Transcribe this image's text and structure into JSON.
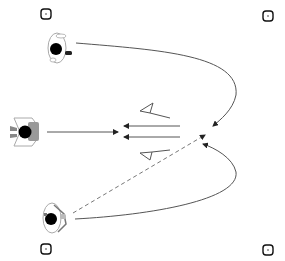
{
  "diagram": {
    "type": "training-drill-top-view",
    "background": "#ffffff",
    "colors": {
      "line": "#555555",
      "marker": "#111111",
      "head": "#000000",
      "body_outline": "#999999",
      "shoulder": "#888888"
    },
    "corner_markers": [
      {
        "id": "tl",
        "x": 46,
        "y": 14
      },
      {
        "id": "tr",
        "x": 268,
        "y": 16
      },
      {
        "id": "bl",
        "x": 46,
        "y": 249
      },
      {
        "id": "br",
        "x": 268,
        "y": 250
      }
    ],
    "players": [
      {
        "id": "top-player",
        "x": 56,
        "y": 48,
        "facing": "right"
      },
      {
        "id": "middle-player",
        "x": 25,
        "y": 131,
        "facing": "right",
        "shaded": true
      },
      {
        "id": "bottom-player",
        "x": 51,
        "y": 218,
        "facing": "right"
      }
    ],
    "arrows": [
      {
        "id": "top-curve",
        "style": "solid",
        "from": [
          76,
          43
        ],
        "to": [
          213,
          126
        ]
      },
      {
        "id": "bottom-curve",
        "style": "solid",
        "from": [
          75,
          219
        ],
        "to": [
          203,
          144
        ]
      },
      {
        "id": "dashed-diagonal",
        "style": "dashed",
        "from": [
          73,
          213
        ],
        "to": [
          205,
          135
        ]
      },
      {
        "id": "middle-straight",
        "style": "solid",
        "from": [
          47,
          132
        ],
        "to": [
          118,
          132
        ]
      },
      {
        "id": "return-upper",
        "style": "solid",
        "from": [
          180,
          126
        ],
        "to": [
          124,
          126
        ]
      },
      {
        "id": "return-lower",
        "style": "solid",
        "from": [
          180,
          137
        ],
        "to": [
          124,
          137
        ]
      }
    ],
    "deflection_marks": [
      {
        "id": "upper-wedge",
        "points": [
          [
            140,
            111
          ],
          [
            153,
            103
          ],
          [
            150,
            113
          ],
          [
            170,
            118
          ]
        ]
      },
      {
        "id": "lower-wedge",
        "points": [
          [
            140,
            153
          ],
          [
            152,
            152
          ],
          [
            150,
            160
          ],
          [
            170,
            150
          ]
        ]
      }
    ]
  }
}
